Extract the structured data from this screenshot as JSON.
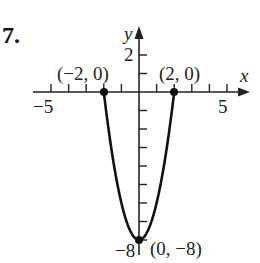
{
  "problem": {
    "number": "7."
  },
  "chart_data": {
    "type": "line",
    "title": "",
    "function": "y = 2x^2 - 8",
    "xlabel": "x",
    "ylabel": "y",
    "xlim": [
      -6.5,
      6.5
    ],
    "ylim": [
      -8.8,
      3.2
    ],
    "x_ticks": [
      -5,
      -4,
      -3,
      -2,
      -1,
      1,
      2,
      3,
      4,
      5
    ],
    "y_ticks": [
      2,
      1,
      -1,
      -2,
      -3,
      -4,
      -5,
      -6,
      -7,
      -8
    ],
    "x_tick_labels": [
      "-5",
      "5"
    ],
    "y_tick_labels": [
      "2",
      "-8"
    ],
    "grid": false,
    "series": [
      {
        "name": "parabola",
        "x": [
          -2.4,
          -2,
          -1.5,
          -1,
          -0.5,
          0,
          0.5,
          1,
          1.5,
          2,
          2.4
        ],
        "values": [
          3.52,
          0,
          -3.5,
          -6,
          -7.5,
          -8,
          -7.5,
          -6,
          -3.5,
          0,
          3.52
        ]
      }
    ],
    "points": [
      {
        "x": -2,
        "y": 0,
        "label": "(−2, 0)"
      },
      {
        "x": 2,
        "y": 0,
        "label": "(2, 0)"
      },
      {
        "x": 0,
        "y": -8,
        "label": "(0, −8)"
      }
    ],
    "labels": {
      "x_axis": "x",
      "y_axis": "y",
      "x_min_tick": "−5",
      "x_max_tick": "5",
      "y_top_tick": "2",
      "y_bottom_tick": "−8",
      "point_left": "(−2, 0)",
      "point_right": "(2, 0)",
      "point_vertex": "(0, −8)"
    }
  }
}
